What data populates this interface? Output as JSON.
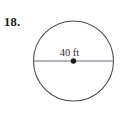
{
  "figure": {
    "problem_number": "18.",
    "background_color": "#ffffff",
    "stroke_color": "#4a4a4a",
    "text_color": "#1a1a1a"
  },
  "diagram": {
    "shape": "circle",
    "center_dot": "center-point-dot",
    "diameter_line": "horizontal-diameter",
    "measurement_label": "40 ft",
    "measurement_value": 40,
    "measurement_unit": "ft",
    "measurement_of": "diameter"
  }
}
